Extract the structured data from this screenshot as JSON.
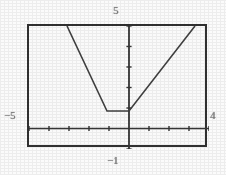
{
  "figure": {
    "kind": "graphing-calculator-screen",
    "frame_color": "#2a2a2a",
    "background_color": "#ffffff",
    "curve_color": "#3a3a3a",
    "axis_color": "#2f2f2f"
  },
  "labels": {
    "top": "5",
    "left": "−5",
    "right": "4",
    "bottom": "−1"
  },
  "chart_data": {
    "type": "line",
    "title": "",
    "xlabel": "",
    "ylabel": "",
    "xlim": [
      -5,
      4
    ],
    "ylim": [
      -1,
      5
    ],
    "grid": false,
    "legend": null,
    "axes": {
      "x_axis_y_value": 0,
      "y_axis_x_value": 0,
      "x_tick_step": 1,
      "y_tick_step": 1,
      "x_ticks": [
        -5,
        -4,
        -3,
        -2,
        -1,
        0,
        1,
        2,
        3,
        4
      ],
      "y_ticks": [
        -1,
        0,
        1,
        2,
        3,
        4,
        5
      ],
      "tick_marks_visible": true,
      "tick_labels_visible": false
    },
    "series": [
      {
        "name": "piecewise-trough",
        "description": "Descending ray, flat minimum segment, then ascending ray",
        "x": [
          -3.1,
          -1.1,
          0.0,
          3.3
        ],
        "y": [
          5.0,
          0.85,
          0.85,
          5.0
        ],
        "vertices": [
          {
            "x": -3.1,
            "y": 5.0,
            "role": "left-endpoint-at-top-of-window"
          },
          {
            "x": -1.1,
            "y": 0.85,
            "role": "left-corner-of-flat-minimum"
          },
          {
            "x": 0.0,
            "y": 0.85,
            "role": "right-corner-of-flat-minimum-on-y-axis"
          },
          {
            "x": 3.3,
            "y": 5.0,
            "role": "right-endpoint-at-top-of-window"
          }
        ],
        "segments": [
          {
            "from": [
              -3.1,
              5.0
            ],
            "to": [
              -1.1,
              0.85
            ],
            "slope": -2.08,
            "kind": "decreasing"
          },
          {
            "from": [
              -1.1,
              0.85
            ],
            "to": [
              0.0,
              0.85
            ],
            "slope": 0.0,
            "kind": "constant-minimum"
          },
          {
            "from": [
              0.0,
              0.85
            ],
            "to": [
              3.3,
              5.0
            ],
            "slope": 1.56,
            "kind": "increasing"
          }
        ]
      }
    ]
  }
}
